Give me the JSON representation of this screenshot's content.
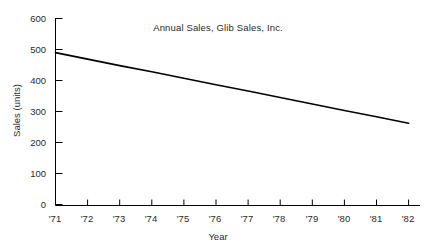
{
  "chart_data": {
    "type": "line",
    "title": "Annual Sales, Glib Sales, Inc.",
    "xlabel": "Year",
    "ylabel": "Sales (units)",
    "x": [
      1971,
      1972,
      1973,
      1974,
      1975,
      1976,
      1977,
      1978,
      1979,
      1980,
      1981,
      1982
    ],
    "xtick_labels": [
      "'71",
      "'72",
      "'73",
      "'74",
      "'75",
      "'76",
      "'77",
      "'78",
      "'79",
      "'80",
      "'81",
      "'82"
    ],
    "ytick_labels": [
      "0",
      "100",
      "200",
      "300",
      "400",
      "500",
      "600"
    ],
    "ytick_values": [
      0,
      100,
      200,
      300,
      400,
      500,
      600
    ],
    "series": [
      {
        "name": "Annual Sales",
        "values": [
          490,
          469,
          448,
          428,
          407,
          386,
          366,
          345,
          324,
          303,
          283,
          262
        ],
        "color": "#000000"
      }
    ],
    "xlim": [
      1971,
      1982
    ],
    "ylim": [
      0,
      600
    ],
    "grid": false,
    "legend": null,
    "line_color": "#000000",
    "axis_color": "#000000",
    "background_color": "#ffffff"
  }
}
